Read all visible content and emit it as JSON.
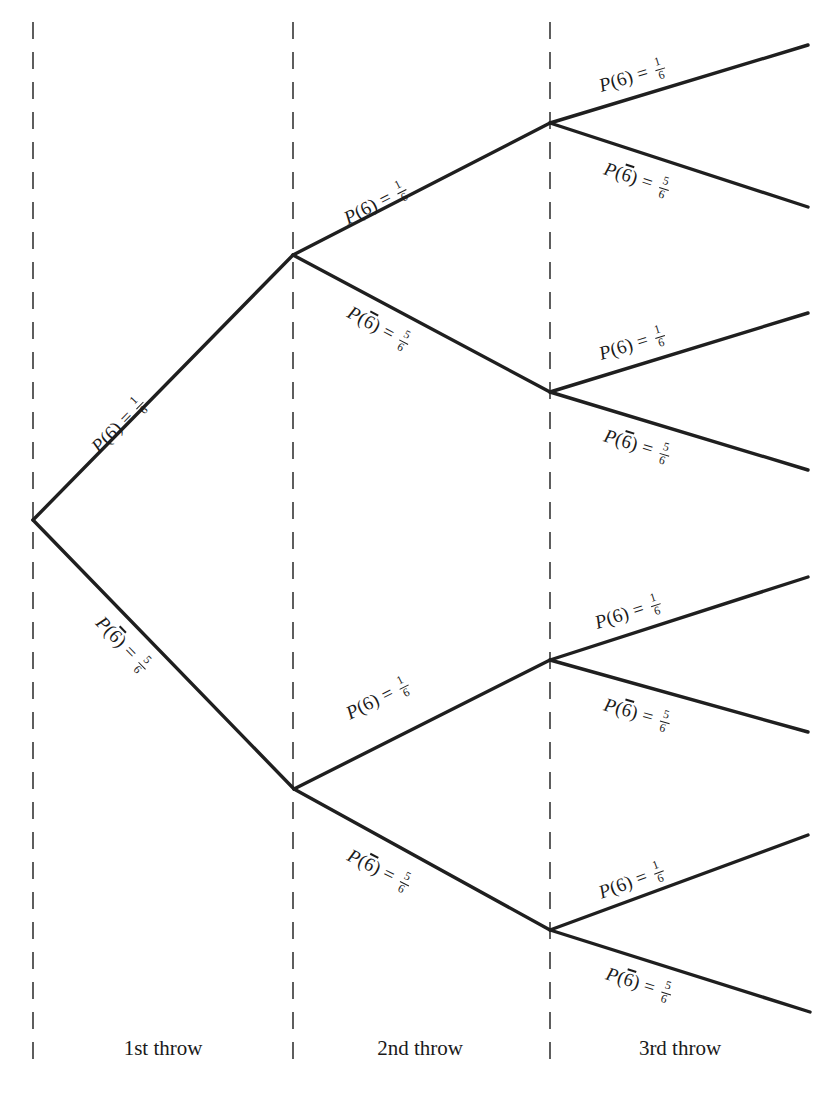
{
  "figure": {
    "kind": "probability-tree-diagram",
    "line_color": "#1f1f1f",
    "divider_color": "#4d4d4d",
    "background": "#ffffff"
  },
  "labels": {
    "six": {
      "function": "P",
      "open": "(",
      "event": "6",
      "close": ")",
      "equals": "=",
      "numerator": "1",
      "denominator": "6",
      "text": "P(6) = 1/6"
    },
    "not_six": {
      "function": "P",
      "open": "(",
      "event": "6",
      "close": ")",
      "equals": "=",
      "numerator": "5",
      "denominator": "6",
      "overline": true,
      "text": "P(6̅) = 5/6"
    }
  },
  "stages": [
    {
      "id": "stage-1",
      "caption": "1st throw",
      "divider_x": 33,
      "caption_x": 163
    },
    {
      "id": "stage-2",
      "caption": "2nd throw",
      "divider_x": 293,
      "caption_x": 420
    },
    {
      "id": "stage-3",
      "caption": "3rd throw",
      "divider_x": 550,
      "caption_x": 680
    }
  ],
  "nodes": {
    "root": {
      "x": 33,
      "y": 520
    },
    "throw2": [
      {
        "id": "n-6",
        "x": 293,
        "y": 255,
        "path": "6"
      },
      {
        "id": "n-nb",
        "x": 294,
        "y": 789,
        "path": "not6"
      }
    ],
    "throw3": [
      {
        "id": "n-66",
        "x": 550,
        "y": 123,
        "path": "6,6"
      },
      {
        "id": "n-6n",
        "x": 550,
        "y": 392,
        "path": "6,not6"
      },
      {
        "id": "n-n6",
        "x": 550,
        "y": 660,
        "path": "not6,6"
      },
      {
        "id": "n-nn",
        "x": 550,
        "y": 930,
        "path": "not6,not6"
      }
    ],
    "terminals": [
      {
        "id": "t-666",
        "x": 808,
        "y": 45
      },
      {
        "id": "t-66n",
        "x": 808,
        "y": 207
      },
      {
        "id": "t-6n6",
        "x": 808,
        "y": 313
      },
      {
        "id": "t-6nn",
        "x": 808,
        "y": 470
      },
      {
        "id": "t-n66",
        "x": 808,
        "y": 577
      },
      {
        "id": "t-n6n",
        "x": 808,
        "y": 732
      },
      {
        "id": "t-nn6",
        "x": 808,
        "y": 835
      },
      {
        "id": "t-nnn",
        "x": 810,
        "y": 1012
      }
    ]
  },
  "branches": [
    {
      "id": "b1-6",
      "from": "root",
      "to": "n-6",
      "outcome": "six",
      "label_x": 96,
      "label_y": 438,
      "angle": -45.6
    },
    {
      "id": "b1-n6",
      "from": "root",
      "to": "n-nb",
      "outcome": "not_six",
      "label_x": 98,
      "label_y": 608,
      "angle": 45.9
    },
    {
      "id": "b2-66",
      "from": "n-6",
      "to": "n-66",
      "outcome": "six",
      "label_x": 346,
      "label_y": 208,
      "angle": -27.2
    },
    {
      "id": "b2-6n",
      "from": "n-6",
      "to": "n-6n",
      "outcome": "not_six",
      "label_x": 348,
      "label_y": 300,
      "angle": 28.1
    },
    {
      "id": "b2-n6",
      "from": "n-nb",
      "to": "n-n6",
      "outcome": "six",
      "label_x": 348,
      "label_y": 703,
      "angle": -26.8
    },
    {
      "id": "b2-nn",
      "from": "n-nb",
      "to": "n-nn",
      "outcome": "not_six",
      "label_x": 348,
      "label_y": 843,
      "angle": 26.6
    },
    {
      "id": "b3-666",
      "from": "n-66",
      "to": "t-666",
      "outcome": "six",
      "label_x": 600,
      "label_y": 75,
      "angle": -16.8
    },
    {
      "id": "b3-66n",
      "from": "n-66",
      "to": "t-66n",
      "outcome": "not_six",
      "label_x": 604,
      "label_y": 157,
      "angle": 18.0
    },
    {
      "id": "b3-6n6",
      "from": "n-6n",
      "to": "t-6n6",
      "outcome": "six",
      "label_x": 600,
      "label_y": 343,
      "angle": -17.1
    },
    {
      "id": "b3-6nn",
      "from": "n-6n",
      "to": "t-6nn",
      "outcome": "not_six",
      "label_x": 604,
      "label_y": 424,
      "angle": 16.9
    },
    {
      "id": "b3-n66",
      "from": "n-n6",
      "to": "t-n66",
      "outcome": "six",
      "label_x": 596,
      "label_y": 612,
      "angle": -17.9
    },
    {
      "id": "b3-n6n",
      "from": "n-n6",
      "to": "t-n6n",
      "outcome": "not_six",
      "label_x": 604,
      "label_y": 693,
      "angle": 15.6
    },
    {
      "id": "b3-nn6",
      "from": "n-nn",
      "to": "t-nn6",
      "outcome": "six",
      "label_x": 600,
      "label_y": 882,
      "angle": -20.4
    },
    {
      "id": "b3-nnn",
      "from": "n-nn",
      "to": "t-nnn",
      "outcome": "not_six",
      "label_x": 606,
      "label_y": 962,
      "angle": 17.5
    }
  ]
}
